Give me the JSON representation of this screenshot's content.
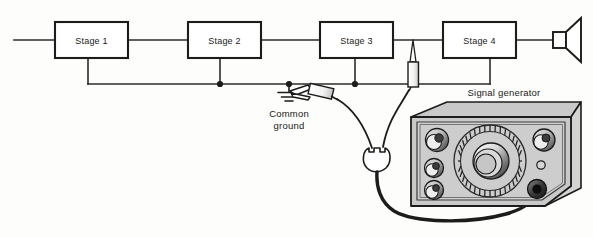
{
  "diagram": {
    "background_color": "#fdfdfb",
    "line_color": "#2b2b2b",
    "panel_color": "#c9c9c9",
    "stages": [
      {
        "id": "stage-1",
        "label": "Stage 1"
      },
      {
        "id": "stage-2",
        "label": "Stage 2"
      },
      {
        "id": "stage-3",
        "label": "Stage 3"
      },
      {
        "id": "stage-4",
        "label": "Stage 4"
      }
    ],
    "labels": {
      "common_ground_line1": "Common",
      "common_ground_line2": "ground",
      "signal_generator": "Signal generator"
    },
    "components": {
      "speaker": "speaker",
      "ground_symbol": "earth-ground",
      "probe_tip": "signal-injection-probe",
      "ground_clip": "alligator-clip",
      "plug": "two-lead-plug",
      "cable": "coaxial-test-lead"
    },
    "generator_controls": {
      "left_knobs": 3,
      "right_knobs": 1,
      "indicator_lamps": 1,
      "output_jacks": 1,
      "dial_ticks": 36
    }
  }
}
